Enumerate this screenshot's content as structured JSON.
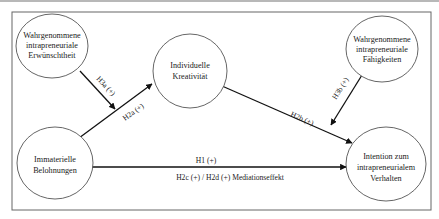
{
  "diagram": {
    "nodes": {
      "erwuenschtheit": {
        "lines": [
          "Wahrgenommene",
          "intrapreneuriale",
          "Erwünschtheit"
        ]
      },
      "kreativitaet": {
        "lines": [
          "Individuelle",
          "Kreativität"
        ]
      },
      "faehigkeiten": {
        "lines": [
          "Wahrgenommene",
          "intrapreneuriale",
          "Fähigkeiten"
        ]
      },
      "belohnungen": {
        "lines": [
          "Immaterielle",
          "Belohnungen"
        ]
      },
      "intention": {
        "lines": [
          "Intention zum",
          "intrapreneurialem",
          "Verhalten"
        ]
      }
    },
    "edges": {
      "h1": {
        "label": "H1 (+)"
      },
      "h2a": {
        "label": "H2a (+)"
      },
      "h2b": {
        "label": "H2b (+)"
      },
      "h2cd": {
        "label": "H2c (+) / H2d (+) Mediationseffekt"
      },
      "h3a": {
        "label": "H3a (+)"
      },
      "h3b": {
        "label": "H3b (+)"
      }
    },
    "colors": {
      "stroke": "#111111",
      "circle": "#555555",
      "frame": "#666666",
      "text": "#222222"
    }
  }
}
